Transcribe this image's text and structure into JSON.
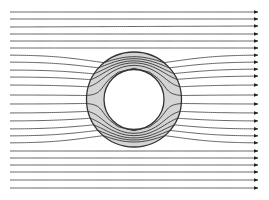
{
  "diagram": {
    "type": "streamline-field",
    "width": 269,
    "height": 200,
    "colors": {
      "background": "#ffffff",
      "streamline": "#555555",
      "arrowhead": "#222222",
      "shell_fill": "#d4d4d4",
      "shell_stroke": "#333333",
      "core_fill": "#ffffff"
    },
    "shell": {
      "cx": 134,
      "cy": 99.5,
      "outer_r": 47.5,
      "inner_r": 30
    },
    "field": {
      "x_start": 10,
      "x_end": 258,
      "left_y": [
        12,
        19,
        27,
        34,
        41,
        48,
        55,
        62,
        70,
        77,
        85,
        95,
        104,
        113,
        121,
        129,
        136,
        143,
        151,
        158,
        165,
        172,
        180,
        188
      ],
      "right_y": [
        12,
        19,
        26,
        34,
        41,
        48,
        55,
        62,
        69,
        76,
        85,
        95,
        104,
        113,
        121,
        129,
        136,
        143,
        151,
        158,
        165,
        172,
        180,
        188
      ]
    }
  }
}
